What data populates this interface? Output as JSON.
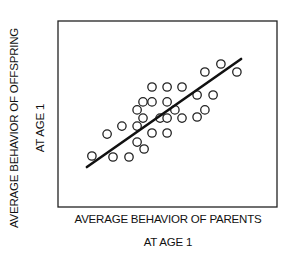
{
  "chart_data": {
    "type": "scatter",
    "title": "",
    "xlabel": "AVERAGE BEHAVIOR OF PARENTS AT AGE 1",
    "ylabel": "AVERAGE BEHAVIOR OF OFFSPRING AT AGE 1",
    "xlabel_lines": [
      "AVERAGE BEHAVIOR OF PARENTS",
      "AT AGE 1"
    ],
    "ylabel_lines": [
      "AVERAGE BEHAVIOR OF OFFSPRING",
      "AT AGE 1"
    ],
    "axis_ticks": "none",
    "grid": false,
    "legend": null,
    "coordinate_note": "Chart has no tick labels. Point and line values below are estimated pixel positions normalized to an arbitrary 0-100 scale per axis; they are not values shown in the figure.",
    "xlim": [
      0,
      100
    ],
    "ylim": [
      0,
      100
    ],
    "marker": "open-circle",
    "points": [
      {
        "x": 15.5,
        "y": 27.4
      },
      {
        "x": 22.4,
        "y": 39.2
      },
      {
        "x": 25.1,
        "y": 26.9
      },
      {
        "x": 29.2,
        "y": 43.5
      },
      {
        "x": 32.4,
        "y": 26.9
      },
      {
        "x": 36.1,
        "y": 52.2
      },
      {
        "x": 36.1,
        "y": 43.5
      },
      {
        "x": 36.1,
        "y": 34.9
      },
      {
        "x": 39.3,
        "y": 31.2
      },
      {
        "x": 38.8,
        "y": 56.5
      },
      {
        "x": 38.8,
        "y": 47.8
      },
      {
        "x": 42.9,
        "y": 64.5
      },
      {
        "x": 42.9,
        "y": 56.5
      },
      {
        "x": 42.9,
        "y": 39.8
      },
      {
        "x": 46.6,
        "y": 47.8
      },
      {
        "x": 49.8,
        "y": 64.5
      },
      {
        "x": 49.8,
        "y": 56.5
      },
      {
        "x": 49.8,
        "y": 47.8
      },
      {
        "x": 49.8,
        "y": 39.8
      },
      {
        "x": 53.4,
        "y": 52.2
      },
      {
        "x": 56.6,
        "y": 64.5
      },
      {
        "x": 56.6,
        "y": 47.8
      },
      {
        "x": 63.5,
        "y": 60.2
      },
      {
        "x": 63.5,
        "y": 48.4
      },
      {
        "x": 67.1,
        "y": 72.6
      },
      {
        "x": 67.1,
        "y": 52.2
      },
      {
        "x": 70.8,
        "y": 60.2
      },
      {
        "x": 74.4,
        "y": 76.9
      },
      {
        "x": 81.7,
        "y": 72.6
      }
    ],
    "trend_line": {
      "x1": 13.2,
      "y1": 21.5,
      "x2": 83.6,
      "y2": 79.6
    },
    "frame": {
      "left": 58,
      "top": 21,
      "right": 277,
      "bottom": 207
    }
  }
}
